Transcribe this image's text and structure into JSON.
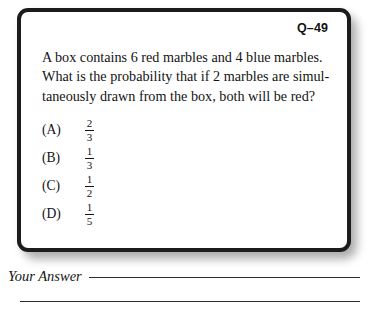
{
  "card": {
    "question_number": "Q–49",
    "question_lines": [
      "A box contains 6 red marbles and 4 blue marbles.",
      "What is the probability that if 2 marbles are simul-",
      "taneously drawn from the box, both will be red?"
    ],
    "choices": [
      {
        "label": "(A)",
        "numerator": "2",
        "denominator": "3"
      },
      {
        "label": "(B)",
        "numerator": "1",
        "denominator": "3"
      },
      {
        "label": "(C)",
        "numerator": "1",
        "denominator": "2"
      },
      {
        "label": "(D)",
        "numerator": "1",
        "denominator": "5"
      }
    ]
  },
  "answer": {
    "label": "Your Answer"
  },
  "colors": {
    "border": "#1c1c1c",
    "text": "#131313",
    "rule": "#2a2a2a",
    "page_background": "#ffffff"
  }
}
